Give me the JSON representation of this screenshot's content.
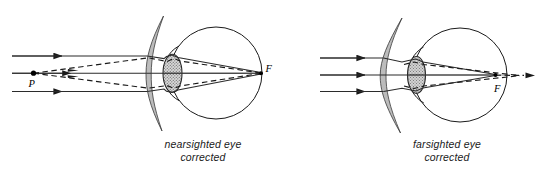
{
  "figure": {
    "background_color": "#ffffff",
    "ink_color": "#1a1a1a",
    "lens_fill_color": "#b9b9b9",
    "eye_lens_fill_color": "#bdbdbd"
  },
  "panels": [
    {
      "id": "nearsighted",
      "caption_line1": "nearsighted eye",
      "caption_line2": "corrected",
      "labels": {
        "object_point": "P",
        "focal_point": "F"
      },
      "spectacle_lens_type": "concave",
      "ray_count": 3,
      "has_dashed_virtual_rays": true
    },
    {
      "id": "farsighted",
      "caption_line1": "farsighted eye",
      "caption_line2": "corrected",
      "labels": {
        "focal_point": "F"
      },
      "spectacle_lens_type": "convex",
      "ray_count": 3,
      "has_dashed_virtual_rays": true
    }
  ]
}
